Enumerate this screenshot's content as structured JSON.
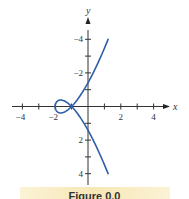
{
  "chart_data": {
    "type": "line",
    "title": "",
    "xlabel": "x",
    "ylabel": "y",
    "xlim": [
      -5,
      5
    ],
    "ylim": [
      -5,
      5
    ],
    "x_ticks": [
      -4,
      -2,
      2,
      4
    ],
    "y_ticks": [
      -4,
      -2,
      2,
      4
    ],
    "x_minor_ticks": [
      -4,
      -3,
      -2,
      -1,
      1,
      2,
      3,
      4
    ],
    "y_minor_ticks": [
      -4,
      -3,
      -2,
      -1,
      1,
      2,
      3,
      4
    ],
    "grid": false,
    "series": [
      {
        "name": "parametric curve",
        "color": "#2e5fa8",
        "parametric": {
          "x": "t^2 - 2",
          "y": "t^3 - t",
          "t_range": [
            -1.8,
            1.8
          ]
        },
        "points": [
          {
            "x": 1.24,
            "y": -4.03
          },
          {
            "x": 0.56,
            "y": -2.54
          },
          {
            "x": 0.0,
            "y": -1.41
          },
          {
            "x": -0.56,
            "y": -0.53
          },
          {
            "x": -1.0,
            "y": 0.0
          },
          {
            "x": -1.64,
            "y": 0.38
          },
          {
            "x": -2.0,
            "y": 0.0
          },
          {
            "x": -1.64,
            "y": -0.38
          },
          {
            "x": -1.0,
            "y": 0.0
          },
          {
            "x": -0.56,
            "y": 0.53
          },
          {
            "x": 0.0,
            "y": 1.41
          },
          {
            "x": 0.56,
            "y": 2.54
          },
          {
            "x": 1.24,
            "y": 4.03
          }
        ]
      }
    ],
    "annotations": [
      "self-intersection at (-1, 0)"
    ]
  },
  "axes": {
    "x_label": "x",
    "y_label": "y",
    "x_tick_labels": [
      "−4",
      "−2",
      "2",
      "4"
    ],
    "y_tick_labels": [
      "4",
      "2",
      "−2",
      "−4"
    ]
  },
  "caption": "Figure 0.0"
}
